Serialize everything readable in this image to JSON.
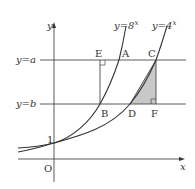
{
  "diagram": {
    "curve_labels": {
      "curve1": "y = 8^x",
      "curve2": "y = 4^x"
    },
    "line_labels": {
      "line_a": "y = a",
      "line_b": "y = b"
    },
    "points": {
      "A": "A",
      "B": "B",
      "C": "C",
      "D": "D",
      "E": "E",
      "F": "F",
      "O": "O"
    },
    "axis_labels": {
      "x": "x",
      "y": "y",
      "one": "1"
    },
    "colors": {
      "shade": "#c8c8c8",
      "line": "#333333"
    }
  },
  "text": {
    "y8": "y=8",
    "y4": "y=4",
    "exp": "x",
    "ya": "y=a",
    "yb": "y=b"
  }
}
